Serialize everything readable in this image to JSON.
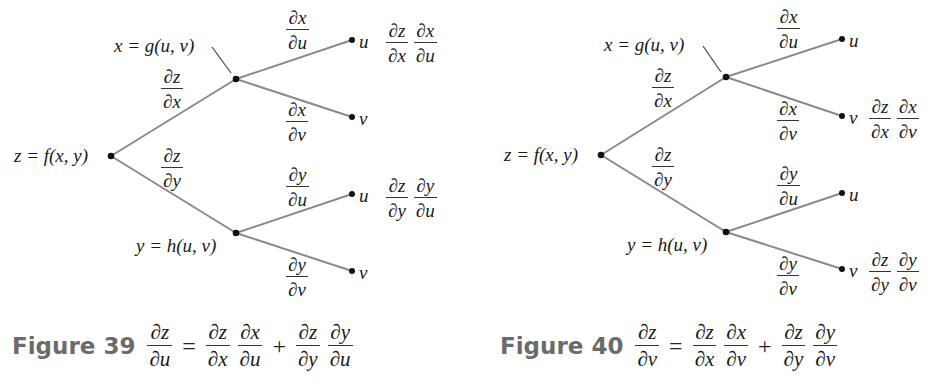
{
  "figures": [
    {
      "id": "fig39",
      "root_label": "z = f(x, y)",
      "x_node_label": "x = g(u, v)",
      "y_node_label": "y = h(u, v)",
      "edges": {
        "z_x": {
          "num": "∂z",
          "den": "∂x"
        },
        "z_y": {
          "num": "∂z",
          "den": "∂y"
        },
        "x_u": {
          "num": "∂x",
          "den": "∂u"
        },
        "x_v": {
          "num": "∂x",
          "den": "∂v"
        },
        "y_u": {
          "num": "∂y",
          "den": "∂u"
        },
        "y_v": {
          "num": "∂y",
          "den": "∂v"
        }
      },
      "leaves": [
        "u",
        "v",
        "u",
        "v"
      ],
      "path_products": [
        {
          "leaf_index": 0,
          "terms": [
            {
              "num": "∂z",
              "den": "∂x"
            },
            {
              "num": "∂x",
              "den": "∂u"
            }
          ]
        },
        {
          "leaf_index": 2,
          "terms": [
            {
              "num": "∂z",
              "den": "∂y"
            },
            {
              "num": "∂y",
              "den": "∂u"
            }
          ]
        }
      ],
      "caption": {
        "title": "Figure 39",
        "lhs": {
          "num": "∂z",
          "den": "∂u"
        },
        "eq": "=",
        "plus": "+",
        "t1a": {
          "num": "∂z",
          "den": "∂x"
        },
        "t1b": {
          "num": "∂x",
          "den": "∂u"
        },
        "t2a": {
          "num": "∂z",
          "den": "∂y"
        },
        "t2b": {
          "num": "∂y",
          "den": "∂u"
        }
      }
    },
    {
      "id": "fig40",
      "root_label": "z = f(x, y)",
      "x_node_label": "x = g(u, v)",
      "y_node_label": "y = h(u, v)",
      "edges": {
        "z_x": {
          "num": "∂z",
          "den": "∂x"
        },
        "z_y": {
          "num": "∂z",
          "den": "∂y"
        },
        "x_u": {
          "num": "∂x",
          "den": "∂u"
        },
        "x_v": {
          "num": "∂x",
          "den": "∂v"
        },
        "y_u": {
          "num": "∂y",
          "den": "∂u"
        },
        "y_v": {
          "num": "∂y",
          "den": "∂v"
        }
      },
      "leaves": [
        "u",
        "v",
        "u",
        "v"
      ],
      "path_products": [
        {
          "leaf_index": 1,
          "terms": [
            {
              "num": "∂z",
              "den": "∂x"
            },
            {
              "num": "∂x",
              "den": "∂v"
            }
          ]
        },
        {
          "leaf_index": 3,
          "terms": [
            {
              "num": "∂z",
              "den": "∂y"
            },
            {
              "num": "∂y",
              "den": "∂v"
            }
          ]
        }
      ],
      "caption": {
        "title": "Figure 40",
        "lhs": {
          "num": "∂z",
          "den": "∂v"
        },
        "eq": "=",
        "plus": "+",
        "t1a": {
          "num": "∂z",
          "den": "∂x"
        },
        "t1b": {
          "num": "∂x",
          "den": "∂v"
        },
        "t2a": {
          "num": "∂z",
          "den": "∂y"
        },
        "t2b": {
          "num": "∂y",
          "den": "∂v"
        }
      }
    }
  ],
  "colors": {
    "edge": "#8a8a8a",
    "node": "#111111",
    "caption_title": "#6b6b6b",
    "text": "#1a1a1a"
  }
}
